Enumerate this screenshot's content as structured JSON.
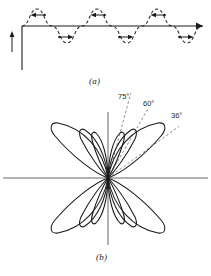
{
  "figure": {
    "panels": [
      {
        "id": "a",
        "caption": "(a)",
        "description": "long-wire-antenna-current-distribution",
        "wire": {
          "y": 26,
          "x_start": 22,
          "x_end": 203,
          "feed_x": 22,
          "feed_y_bottom": 70,
          "feed_arrow_x": 12,
          "feed_arrow_y_top": 33,
          "feed_arrow_y_bottom": 52
        },
        "current_wave": {
          "style": "dashed",
          "amplitude": 17,
          "wavelength": 60,
          "x_start": 22,
          "x_end": 203,
          "lobe_arrows": [
            {
              "x": 37,
              "y": 15,
              "direction": "left"
            },
            {
              "x": 67,
              "y": 37,
              "direction": "right"
            },
            {
              "x": 97,
              "y": 15,
              "direction": "left"
            },
            {
              "x": 127,
              "y": 37,
              "direction": "right"
            },
            {
              "x": 157,
              "y": 15,
              "direction": "left"
            },
            {
              "x": 187,
              "y": 37,
              "direction": "right"
            }
          ]
        }
      },
      {
        "id": "b",
        "caption": "(b)",
        "description": "radiation-pattern-polar-lobes",
        "origin": {
          "x": 108,
          "y": 178
        },
        "axes": {
          "horizontal": {
            "x_start": 3,
            "x_end": 208,
            "y": 178
          },
          "vertical": {
            "x": 108,
            "y_start": 112,
            "y_end": 245
          }
        },
        "lobes": [
          {
            "angle_deg": 36,
            "length": 62,
            "width": 22
          },
          {
            "angle_deg": 60,
            "length": 47,
            "width": 14
          },
          {
            "angle_deg": 75,
            "length": 42,
            "width": 11
          },
          {
            "angle_deg": 144,
            "length": 62,
            "width": 22
          },
          {
            "angle_deg": 120,
            "length": 47,
            "width": 14
          },
          {
            "angle_deg": 105,
            "length": 42,
            "width": 11
          },
          {
            "angle_deg": 216,
            "length": 62,
            "width": 22
          },
          {
            "angle_deg": 240,
            "length": 47,
            "width": 14
          },
          {
            "angle_deg": 255,
            "length": 42,
            "width": 11
          },
          {
            "angle_deg": 324,
            "length": 62,
            "width": 22
          },
          {
            "angle_deg": 300,
            "length": 47,
            "width": 14
          },
          {
            "angle_deg": 285,
            "length": 42,
            "width": 11
          }
        ],
        "angle_markers": [
          {
            "label": "75°",
            "angle_deg": 75,
            "line_length": 88
          },
          {
            "label": "60°",
            "angle_deg": 60,
            "line_length": 82
          },
          {
            "label": "36°",
            "angle_deg": 36,
            "line_length": 88
          }
        ]
      }
    ]
  },
  "style": {
    "stroke_color": "#1a1a1a",
    "dash_color": "#3a3a3a",
    "axis_color": "#555555",
    "background": "#ffffff"
  }
}
